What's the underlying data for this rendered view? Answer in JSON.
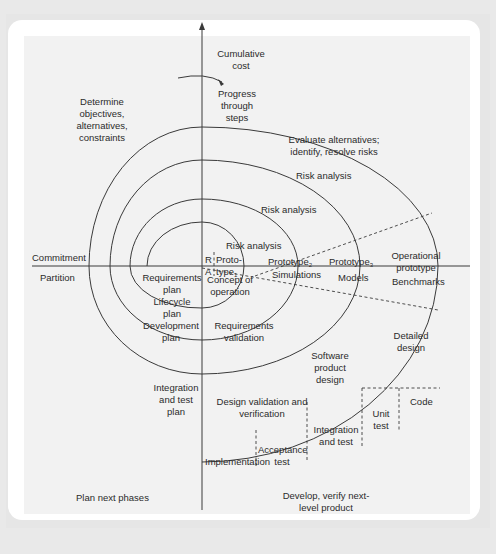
{
  "diagram": {
    "axis": {
      "y_label": "Cumulative cost",
      "progress_label": "Progress through steps"
    },
    "quadrants": {
      "top_left": "Determine objectives, alternatives, constraints",
      "top_right": "Evaluate alternatives; identify, resolve risks",
      "bottom_left": "Plan next phases",
      "bottom_right": "Develop, verify next-level product"
    },
    "left_axis_labels": {
      "above": "Commitment",
      "below": "Partition"
    },
    "risk_analysis": [
      "Risk analysis",
      "Risk analysis",
      "Risk analysis",
      "Risk analysis"
    ],
    "ra": [
      "R",
      "A"
    ],
    "prototypes": [
      {
        "text": "Proto-",
        "text2": "type",
        "sub": "1"
      },
      {
        "text": "Prototype",
        "sub": "2"
      },
      {
        "text": "Prototype",
        "sub": "3"
      },
      {
        "text": "Operational prototype"
      }
    ],
    "simulations_row": [
      "Simulations",
      "Models",
      "Benchmarks"
    ],
    "develop_items": [
      "Concept of operation",
      "Requirements validation",
      "Design validation and verification",
      "Software product design",
      "Detailed design",
      "Code",
      "Unit test",
      "Integration and test",
      "Acceptance test",
      "Implementation"
    ],
    "plan_items": [
      "Requirements plan",
      "Lifecycle plan",
      "Development plan",
      "Integration and test plan"
    ],
    "colors": {
      "line": "#3a3a3a",
      "panel": "#f2f2f2",
      "card": "#ffffff",
      "frame": "#e6e6e6"
    }
  }
}
